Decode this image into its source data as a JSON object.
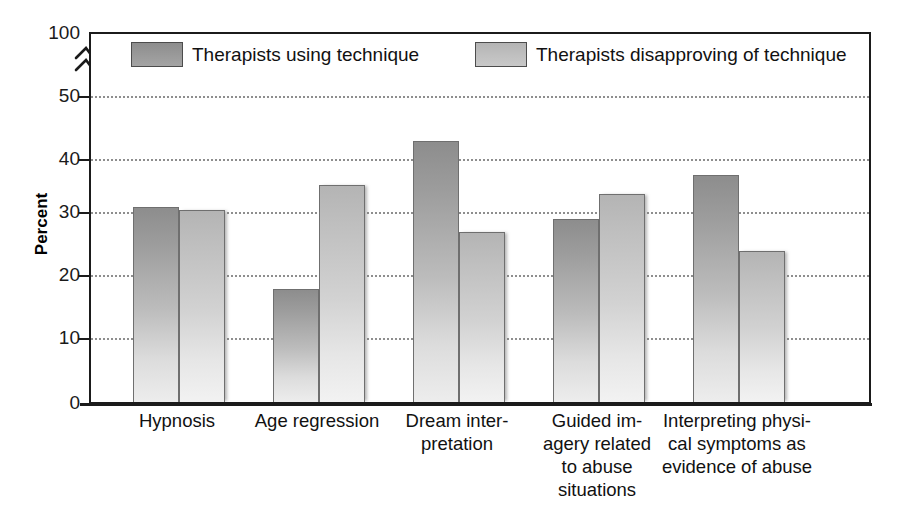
{
  "chart_data": {
    "type": "bar",
    "title": "",
    "xlabel": "",
    "ylabel": "Percent",
    "ylim": [
      0,
      100
    ],
    "y_ticks": [
      0,
      10,
      20,
      30,
      40,
      50,
      100
    ],
    "axis_break": true,
    "axis_break_between": [
      50,
      100
    ],
    "grid": true,
    "grid_axis": "y",
    "legend_position": "top-inside",
    "categories": [
      "Hypnosis",
      "Age regression",
      "Dream interpretation",
      "Guided imagery related to abuse situations",
      "Interpreting physical symptoms as evidence of abuse"
    ],
    "category_label_lines": [
      [
        "Hypnosis"
      ],
      [
        "Age regression"
      ],
      [
        "Dream inter-",
        "pretation"
      ],
      [
        "Guided im-",
        "agery related",
        "to abuse",
        "situations"
      ],
      [
        "Interpreting physi-",
        "cal symptoms as",
        "evidence of abuse"
      ]
    ],
    "series": [
      {
        "name": "Therapists using technique",
        "color": "#8d8d8d",
        "values": [
          31,
          18,
          41.5,
          29,
          36
        ]
      },
      {
        "name": "Therapists disapproving of technique",
        "color": "#b4b4b4",
        "values": [
          30.5,
          34.5,
          27,
          33,
          24
        ]
      }
    ]
  },
  "axis": {
    "y_tick_labels": [
      "100",
      "50",
      "40",
      "30",
      "20",
      "10",
      "0"
    ],
    "y_title": "Percent"
  },
  "legend": {
    "items": [
      {
        "label": "Therapists using technique",
        "swatch": "#8d8d8d"
      },
      {
        "label": "Therapists disapproving of technique",
        "swatch": "#b4b4b4"
      }
    ]
  }
}
